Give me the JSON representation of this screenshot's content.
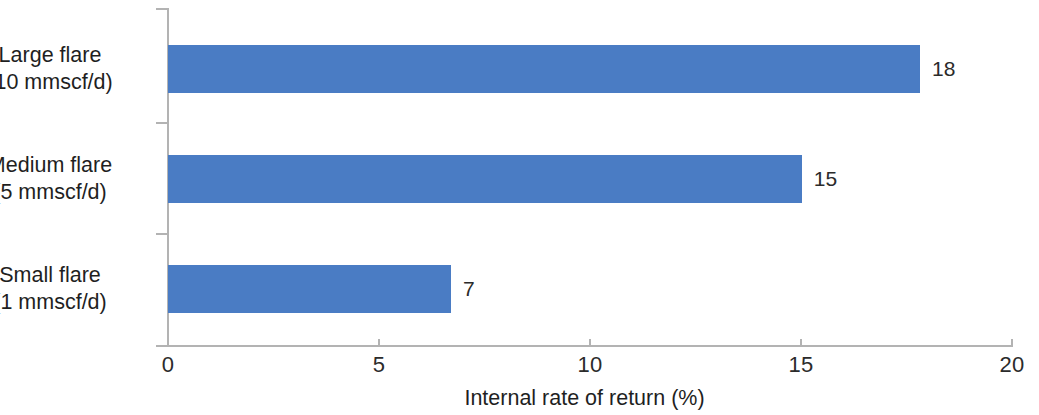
{
  "chart_data": {
    "type": "bar",
    "orientation": "horizontal",
    "title": "",
    "subtitle": "",
    "xlabel": "Internal rate of return (%)",
    "ylabel": "",
    "xlim": [
      0,
      20
    ],
    "xticks": [
      0,
      5,
      10,
      15,
      20
    ],
    "xtick_labels": [
      "0",
      "5",
      "10",
      "15",
      "20"
    ],
    "grid": false,
    "legend": false,
    "legend_position": "none",
    "bar_color": "#4a7cc4",
    "axis_color": "#b3b3b3",
    "text_color": "#1f1f1f",
    "categories": [
      "Large flare (10 mmscf/d)",
      "Medium flare (5 mmscf/d)",
      "Small flare (1 mmscf/d)"
    ],
    "category_lines": [
      [
        "Large flare",
        "(10 mmscf/d)"
      ],
      [
        "Medium flare",
        "(5 mmscf/d)"
      ],
      [
        "Small flare",
        "(1 mmscf/d)"
      ]
    ],
    "values": [
      17.8,
      15.0,
      6.7
    ],
    "data_labels": [
      "18",
      "15",
      "7"
    ],
    "series": [
      {
        "name": "Internal rate of return",
        "values": [
          17.8,
          15.0,
          6.7
        ]
      }
    ]
  },
  "axis": {
    "x_title": "Internal rate of return (%)",
    "tick_0": "0",
    "tick_5": "5",
    "tick_10": "10",
    "tick_15": "15",
    "tick_20": "20"
  },
  "bars": [
    {
      "line1": "Large flare",
      "line2": "(10 mmscf/d)",
      "label": "18",
      "value": 17.8
    },
    {
      "line1": "Medium flare",
      "line2": "(5 mmscf/d)",
      "label": "15",
      "value": 15.0
    },
    {
      "line1": "Small flare",
      "line2": "(1 mmscf/d)",
      "label": "7",
      "value": 6.7
    }
  ]
}
